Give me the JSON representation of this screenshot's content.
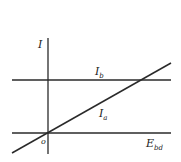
{
  "diagram": {
    "axes": {
      "y_label": "I",
      "x_label_main": "E",
      "x_label_sub": "bd",
      "origin_label": "o"
    },
    "lines": [
      {
        "name": "I_b",
        "label_main": "I",
        "label_sub": "b",
        "type": "horizontal"
      },
      {
        "name": "I_a",
        "label_main": "I",
        "label_sub": "a",
        "type": "diagonal"
      }
    ],
    "colors": {
      "stroke": "#2a2a2a",
      "background": "#ffffff"
    }
  }
}
